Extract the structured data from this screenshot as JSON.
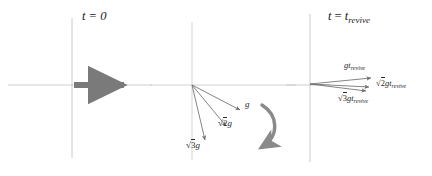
{
  "figure": {
    "width": 432,
    "height": 176,
    "background": "#ffffff",
    "axis_color": "#b9b9b9",
    "vector_color": "#6e6e6e",
    "bold_arrow_color": "#7a7a7a",
    "rotation_arrow_color": "#8a8a8a",
    "text_color": "#2b2b2b"
  },
  "panels": {
    "left": {
      "title": "t = 0",
      "divider_x": 72,
      "axis_y": 85,
      "velocity_arrow": {
        "label": "",
        "start_x": 72,
        "end_x": 126,
        "thickness": 6,
        "color": "#7a7a7a"
      }
    },
    "middle": {
      "title": "",
      "origin_x": 192,
      "origin_y": 85,
      "vectors": [
        {
          "name": "g",
          "label_main": "g",
          "coefficient": "",
          "radical": "",
          "angle_deg": -28,
          "length": 56
        },
        {
          "name": "sqrt2g",
          "label_main": "g",
          "coefficient": "2",
          "radical": "√",
          "angle_deg": -50,
          "length": 54
        },
        {
          "name": "sqrt3g",
          "label_main": "g",
          "coefficient": "3",
          "radical": "√",
          "angle_deg": -73,
          "length": 58
        }
      ],
      "rotation_arrow": {
        "name": "rotation-arrow",
        "direction": "counterclockwise"
      }
    },
    "right": {
      "title": "t = t",
      "title_sub": "revive",
      "divider_x": 310,
      "axis_y": 85,
      "vectors": [
        {
          "name": "gt-revive",
          "coefficient": "",
          "radical": "",
          "base": "gt",
          "sub": "revive",
          "angle_deg": -6,
          "length": 62
        },
        {
          "name": "sqrt2gt-revive",
          "coefficient": "2",
          "radical": "√",
          "base": "gt",
          "sub": "revive",
          "angle_deg": -10,
          "length": 60
        },
        {
          "name": "sqrt3gt-revive",
          "coefficient": "3",
          "radical": "√",
          "base": "gt",
          "sub": "revive",
          "angle_deg": -13,
          "length": 57
        }
      ]
    }
  },
  "labels": {
    "left_title": "t = 0",
    "mid_g": "g",
    "mid_sqrt2g_radical": "√",
    "mid_sqrt2g_num": "2",
    "mid_sqrt2g_base": "g",
    "mid_sqrt3g_radical": "√",
    "mid_sqrt3g_num": "3",
    "mid_sqrt3g_base": "g",
    "right_title_t": "t",
    "right_title_eq": "=",
    "right_title_tbase": "t",
    "right_title_sub": "revive",
    "right_v1_base": "gt",
    "right_v1_sub": "revive",
    "right_v2_radical": "√",
    "right_v2_num": "2",
    "right_v2_base": "gt",
    "right_v2_sub": "revive",
    "right_v3_radical": "√",
    "right_v3_num": "3",
    "right_v3_base": "gt",
    "right_v3_sub": "revive"
  }
}
